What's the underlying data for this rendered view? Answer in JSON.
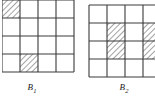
{
  "figure": {
    "type": "grid-diagram-pair",
    "background_color": "#ffffff",
    "line_color": "#3a3a3a",
    "hatch_color": "#555555",
    "panels": [
      {
        "id": "B1",
        "label_text": "B",
        "label_subscript": "1",
        "grid_rows": 4,
        "grid_cols": 4,
        "cell_size_px": 18,
        "cropped_edges": [
          "top",
          "left"
        ],
        "shaded_cells": [
          {
            "row": 0,
            "col": 0,
            "partial": true,
            "note": "clipped at top-left corner"
          },
          {
            "row": 3,
            "col": 1,
            "partial": false
          }
        ]
      },
      {
        "id": "B2",
        "label_text": "B",
        "label_subscript": "2",
        "grid_rows": 4,
        "grid_cols": 4,
        "cell_size_px": 18,
        "cropped_edges": [
          "right"
        ],
        "shaded_cells": [
          {
            "row": 1,
            "col": 1,
            "partial": false
          },
          {
            "row": 2,
            "col": 1,
            "partial": false
          },
          {
            "row": 1,
            "col": 3,
            "partial": true,
            "note": "clipped at right edge"
          },
          {
            "row": 2,
            "col": 3,
            "partial": true,
            "note": "clipped at right edge"
          }
        ]
      }
    ]
  },
  "labels": {
    "b1": "B",
    "b1_sub": "1",
    "b2": "B",
    "b2_sub": "2"
  }
}
